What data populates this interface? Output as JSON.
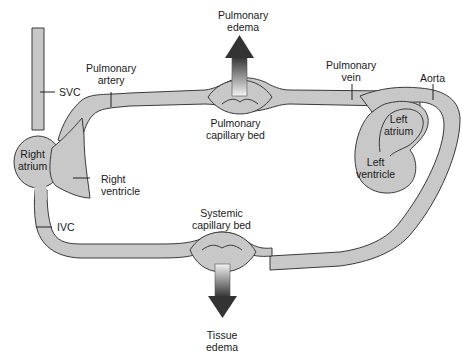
{
  "diagram": {
    "type": "circulation-schematic",
    "colors": {
      "vessel_fill": "#c8c8c8",
      "vessel_stroke": "#3a3a3a",
      "arrow_light": "#f0f0f0",
      "arrow_dark": "#333333",
      "background": "#ffffff"
    },
    "labels": {
      "pulmonary_edema": [
        "Pulmonary",
        "edema"
      ],
      "pulmonary_artery": [
        "Pulmonary",
        "artery"
      ],
      "pulmonary_vein": [
        "Pulmonary",
        "vein"
      ],
      "aorta": "Aorta",
      "svc": "SVC",
      "ivc": "IVC",
      "right_atrium": [
        "Right",
        "atrium"
      ],
      "right_ventricle": [
        "Right",
        "ventricle"
      ],
      "left_atrium": [
        "Left",
        "atrium"
      ],
      "left_ventricle": [
        "Left",
        "ventricle"
      ],
      "pulmonary_capillary_bed": [
        "Pulmonary",
        "capillary bed"
      ],
      "systemic_capillary_bed": [
        "Systemic",
        "capillary bed"
      ],
      "tissue_edema": [
        "Tissue",
        "edema"
      ]
    },
    "arrows": [
      {
        "name": "pulmonary-edema-arrow",
        "direction": "up"
      },
      {
        "name": "tissue-edema-arrow",
        "direction": "down"
      }
    ]
  }
}
